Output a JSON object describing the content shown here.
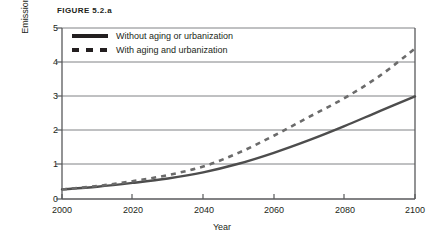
{
  "figure": {
    "title": "FIGURE 5.2.a"
  },
  "chart_data": {
    "type": "line",
    "title": "FIGURE 5.2.a",
    "subtitle": "",
    "xlabel": "Year",
    "ylabel": "Emissions (GtC/yr)",
    "xlim": [
      2000,
      2100
    ],
    "ylim": [
      0,
      5
    ],
    "xticks": [
      "2000",
      "2020",
      "2040",
      "2060",
      "2080",
      "2100"
    ],
    "yticks": [
      "0",
      "1",
      "2",
      "3",
      "4",
      "5"
    ],
    "grid": "horizontal",
    "legend_position": "top-left-inside",
    "x": [
      2000,
      2010,
      2020,
      2030,
      2040,
      2050,
      2060,
      2070,
      2080,
      2090,
      2100
    ],
    "series": [
      {
        "name": "Without aging or urbanization",
        "style": "solid",
        "color": "#4d4d4d",
        "values": [
          0.28,
          0.36,
          0.47,
          0.6,
          0.78,
          1.03,
          1.35,
          1.72,
          2.13,
          2.57,
          3.0
        ]
      },
      {
        "name": "With aging and urbanization",
        "style": "dashed",
        "color": "#6b6b6b",
        "values": [
          0.28,
          0.38,
          0.52,
          0.7,
          0.95,
          1.35,
          1.85,
          2.4,
          2.95,
          3.6,
          4.4
        ]
      }
    ]
  },
  "legend": {
    "items": [
      {
        "label": "Without aging or urbanization",
        "style": "solid"
      },
      {
        "label": "With aging and urbanization",
        "style": "dashed"
      }
    ]
  },
  "axes": {
    "x_label": "Year",
    "y_label": "Emissions (GtC/yr)",
    "x_ticks": [
      "2000",
      "2020",
      "2040",
      "2060",
      "2080",
      "2100"
    ],
    "y_ticks": [
      "5",
      "4",
      "3",
      "2",
      "1",
      "0"
    ]
  },
  "colors": {
    "text": "#231f20",
    "axis": "#58595b",
    "grid": "#808285",
    "solid_series": "#4d4d4d",
    "dashed_series": "#6b6b6b",
    "background": "#ffffff"
  }
}
